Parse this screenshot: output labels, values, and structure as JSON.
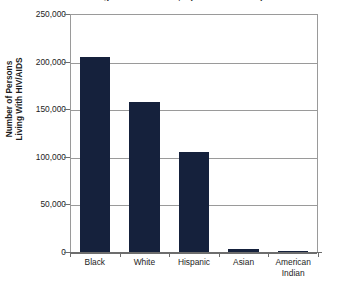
{
  "chart_data": {
    "type": "bar",
    "title": "Persons Living With HIV/AIDS, by Race/Ethnicity",
    "xlabel": "",
    "ylabel_line1": "Number of Persons",
    "ylabel_line2": "Living With HIV/AIDS",
    "categories": [
      "Black",
      "White",
      "Hispanic",
      "Asian",
      "American Indian"
    ],
    "category_lines": [
      [
        "Black"
      ],
      [
        "White"
      ],
      [
        "Hispanic"
      ],
      [
        "Asian"
      ],
      [
        "American",
        "Indian"
      ]
    ],
    "values": [
      205000,
      158000,
      105000,
      3000,
      1000
    ],
    "ylim": [
      0,
      250000
    ],
    "yticks": [
      0,
      50000,
      100000,
      150000,
      200000,
      250000
    ],
    "ytick_labels": [
      "0",
      "50,000",
      "100,000",
      "150,000",
      "200,000",
      "250,000"
    ],
    "grid": true,
    "legend": false,
    "colors": {
      "bar": "#15213c",
      "gridline": "#9a9a9a",
      "axis": "#6d6d6d",
      "text": "#1c1c1c",
      "background": "#ffffff"
    }
  }
}
